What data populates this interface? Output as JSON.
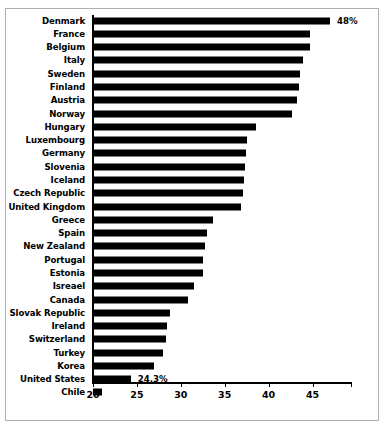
{
  "chart_data": {
    "type": "bar",
    "orientation": "horizontal",
    "title": "",
    "xlabel": "",
    "ylabel": "",
    "xlim": [
      20,
      49.5
    ],
    "grid": false,
    "legend": null,
    "xticks": [
      20,
      25,
      30,
      35,
      40,
      45
    ],
    "xtick_labels": [
      "20",
      "25",
      "30",
      "35",
      "40",
      "45"
    ],
    "categories": [
      "Denmark",
      "France",
      "Belgium",
      "Italy",
      "Sweden",
      "Finland",
      "Austria",
      "Norway",
      "Hungary",
      "Luxembourg",
      "Germany",
      "Slovenia",
      "Iceland",
      "Czech Republic",
      "United Kingdom",
      "Greece",
      "Spain",
      "New Zealand",
      "Portugal",
      "Estonia",
      "Isreael",
      "Canada",
      "Slovak Republic",
      "Ireland",
      "Switzerland",
      "Turkey",
      "Korea",
      "United States",
      "Chile"
    ],
    "values": [
      47.0,
      44.7,
      44.7,
      43.9,
      43.6,
      43.5,
      43.2,
      42.7,
      38.6,
      37.5,
      37.4,
      37.3,
      37.2,
      37.1,
      36.8,
      33.7,
      33.0,
      32.8,
      32.5,
      32.5,
      31.5,
      30.8,
      28.8,
      28.4,
      28.3,
      28.0,
      27.0,
      24.3,
      21.0
    ],
    "annotations": [
      {
        "category": "Denmark",
        "text": "48%"
      },
      {
        "category": "United States",
        "text": "24.3%"
      }
    ],
    "bar_color": "#000000",
    "axis_color": "#000000",
    "background_color": "#ffffff"
  }
}
